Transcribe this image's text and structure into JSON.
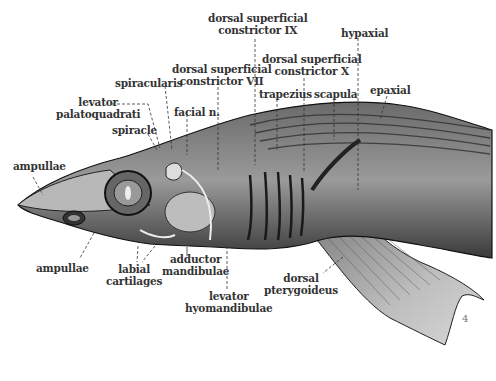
{
  "figure": {
    "corner_mark": "4",
    "labels": {
      "dsc_ix": [
        "dorsal superficial",
        "constrictor IX"
      ],
      "hypaxial": [
        "hypaxial"
      ],
      "dsc_x": [
        "dorsal superficial",
        "constrictor X"
      ],
      "dsc_vii": [
        "dorsal superficial",
        "constrictor VII"
      ],
      "spiracularis": [
        "spiracularis"
      ],
      "levator_palatoquadrati": [
        "levator",
        "palatoquadrati"
      ],
      "trapezius": [
        "trapezius"
      ],
      "scapula": [
        "scapula"
      ],
      "epaxial": [
        "epaxial"
      ],
      "facial_n": [
        "facial n."
      ],
      "spiracle": [
        "spiracle"
      ],
      "ampullae_top": [
        "ampullae"
      ],
      "ampullae_bottom": [
        "ampullae"
      ],
      "labial_cartilages": [
        "labial",
        "cartilages"
      ],
      "adductor_mandibulae": [
        "adductor",
        "mandibulae"
      ],
      "levator_hyomandibulae": [
        "levator",
        "hyomandibulae"
      ],
      "dorsal_pterygoideus": [
        "dorsal",
        "pterygoideus"
      ]
    }
  }
}
